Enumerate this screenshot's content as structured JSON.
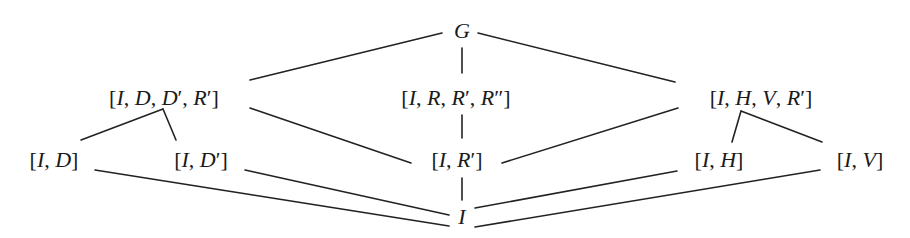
{
  "diagram": {
    "type": "subgroup-lattice",
    "nodes": {
      "G": {
        "label": "G",
        "x": 462,
        "y": 31
      },
      "IDDpRp": {
        "label": "[I, D, D′, R′]",
        "x": 164,
        "y": 98
      },
      "IRRpRpp": {
        "label": "[I, R, R′, R″]",
        "x": 456,
        "y": 98
      },
      "IHVRp": {
        "label": "[I, H, V, R′]",
        "x": 761,
        "y": 98
      },
      "ID": {
        "label": "[I, D]",
        "x": 54,
        "y": 160
      },
      "IDp": {
        "label": "[I, D′]",
        "x": 201,
        "y": 160
      },
      "IRp": {
        "label": "[I, R′]",
        "x": 457,
        "y": 160
      },
      "IH": {
        "label": "[I, H]",
        "x": 719,
        "y": 160
      },
      "IV": {
        "label": "[I, V]",
        "x": 860,
        "y": 160
      },
      "I": {
        "label": "I",
        "x": 462,
        "y": 217
      }
    },
    "edges": [
      {
        "from": "G",
        "to": "IDDpRp",
        "x1": 442,
        "y1": 33,
        "x2": 250,
        "y2": 80
      },
      {
        "from": "G",
        "to": "IRRpRpp",
        "x1": 462,
        "y1": 48,
        "x2": 462,
        "y2": 73
      },
      {
        "from": "G",
        "to": "IHVRp",
        "x1": 478,
        "y1": 33,
        "x2": 675,
        "y2": 82
      },
      {
        "from": "IDDpRp",
        "to": "ID",
        "x1": 163,
        "y1": 109,
        "x2": 81,
        "y2": 140
      },
      {
        "from": "IDDpRp",
        "to": "IDp",
        "x1": 163,
        "y1": 109,
        "x2": 176,
        "y2": 140
      },
      {
        "from": "IDDpRp",
        "to": "IRp",
        "x1": 250,
        "y1": 108,
        "x2": 411,
        "y2": 163
      },
      {
        "from": "IRRpRpp",
        "to": "IRp",
        "x1": 462,
        "y1": 115,
        "x2": 462,
        "y2": 138
      },
      {
        "from": "IHVRp",
        "to": "IRp",
        "x1": 678,
        "y1": 108,
        "x2": 502,
        "y2": 163
      },
      {
        "from": "IHVRp",
        "to": "IH",
        "x1": 741,
        "y1": 111,
        "x2": 732,
        "y2": 142
      },
      {
        "from": "IHVRp",
        "to": "IV",
        "x1": 741,
        "y1": 111,
        "x2": 822,
        "y2": 142
      },
      {
        "from": "ID",
        "to": "I",
        "x1": 95,
        "y1": 170,
        "x2": 449,
        "y2": 226
      },
      {
        "from": "IDp",
        "to": "I",
        "x1": 245,
        "y1": 170,
        "x2": 449,
        "y2": 215
      },
      {
        "from": "IRp",
        "to": "I",
        "x1": 462,
        "y1": 178,
        "x2": 462,
        "y2": 200
      },
      {
        "from": "IH",
        "to": "I",
        "x1": 677,
        "y1": 171,
        "x2": 475,
        "y2": 208
      },
      {
        "from": "IV",
        "to": "I",
        "x1": 820,
        "y1": 170,
        "x2": 475,
        "y2": 227
      }
    ]
  }
}
